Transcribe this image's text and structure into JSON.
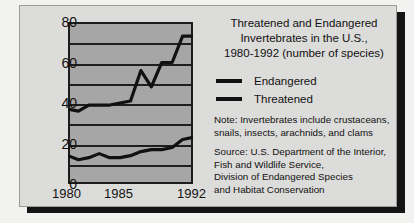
{
  "panel": {
    "title_lines": [
      "Threatened and Endangered",
      "Invertebrates in the U.S.,",
      "1980-1992 (number of species)"
    ],
    "note_lines": [
      "Note: Invertebrates include crustaceans,",
      "snails, insects, arachnids, and clams"
    ],
    "source_lines": [
      "Source: U.S. Department of the Interior,",
      "Fish and Wildlife Service,",
      "Division of Endangered Species",
      "and Habitat Conservation"
    ]
  },
  "colors": {
    "page_background": "#f2f2f0",
    "card_background": "#dcdcda",
    "plot_background": "#a6a6a6",
    "line_color": "#111111",
    "gridline_color": "#1f1f1f",
    "shadow_color": "#141414"
  },
  "chart_data": {
    "type": "line",
    "xlabel": "",
    "ylabel": "",
    "xlim": [
      1980,
      1992
    ],
    "ylim": [
      0,
      80
    ],
    "grid": true,
    "gridlines": [
      0,
      10,
      20,
      30,
      40,
      50,
      60,
      70,
      80
    ],
    "ytick_labels": [
      "0",
      "20",
      "40",
      "60",
      "80"
    ],
    "ytick_values": [
      0,
      20,
      40,
      60,
      80
    ],
    "xtick_labels": [
      "1980",
      "1985",
      "1992"
    ],
    "xtick_values": [
      1980,
      1985,
      1992
    ],
    "legend_position": "right",
    "x": [
      1980,
      1981,
      1982,
      1983,
      1984,
      1985,
      1986,
      1987,
      1988,
      1989,
      1990,
      1991,
      1992
    ],
    "series": [
      {
        "name": "Endangered",
        "values": [
          37,
          36,
          39,
          39,
          39,
          40,
          41,
          56,
          48,
          60,
          60,
          73,
          73
        ]
      },
      {
        "name": "Threatened",
        "values": [
          14,
          12,
          13,
          15,
          13,
          13,
          14,
          16,
          17,
          17,
          18,
          22,
          23
        ]
      }
    ]
  }
}
